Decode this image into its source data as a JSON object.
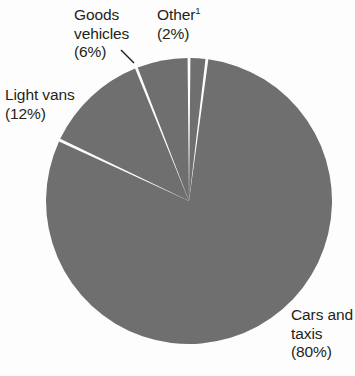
{
  "chart_data": {
    "type": "pie",
    "title": "",
    "subtitle": "",
    "xlabel": "",
    "ylabel": "",
    "legend_position": "none",
    "grid": false,
    "units": "percent",
    "total": 100,
    "start_angle_deg": 0,
    "direction": "clockwise",
    "slice_gap": true,
    "categories": [
      "Other",
      "Cars and taxis",
      "Light vans",
      "Goods vehicles"
    ],
    "values": [
      2,
      80,
      12,
      6
    ],
    "slices": [
      {
        "name": "Other",
        "value": 2,
        "value_label": "(2%)",
        "label_line1": "Other",
        "label_line2": "(2%)",
        "footnote_marker": "1",
        "color": "#6f6f6f",
        "start_deg": 0,
        "end_deg": 7.2
      },
      {
        "name": "Cars and taxis",
        "value": 80,
        "value_label": "(80%)",
        "label_line1": "Cars and",
        "label_line2": "taxis",
        "label_line3": "(80%)",
        "color": "#6f6f6f",
        "start_deg": 7.2,
        "end_deg": 295.2
      },
      {
        "name": "Light vans",
        "value": 12,
        "value_label": "(12%)",
        "label_line1": "Light vans",
        "label_line2": "(12%)",
        "color": "#6f6f6f",
        "start_deg": 295.2,
        "end_deg": 338.4
      },
      {
        "name": "Goods vehicles",
        "value": 6,
        "value_label": "(6%)",
        "label_line1": "Goods",
        "label_line2": "vehicles",
        "label_line3": "(6%)",
        "color": "#6f6f6f",
        "start_deg": 338.4,
        "end_deg": 360
      }
    ],
    "colors": {
      "slice_fill": "#6f6f6f",
      "separator": "#fdfdfd",
      "background": "#fdfdfd",
      "text": "#231f20",
      "leader_line": "#231f20"
    },
    "geometry": {
      "center_x": 189,
      "center_y": 201,
      "radius": 143
    }
  }
}
